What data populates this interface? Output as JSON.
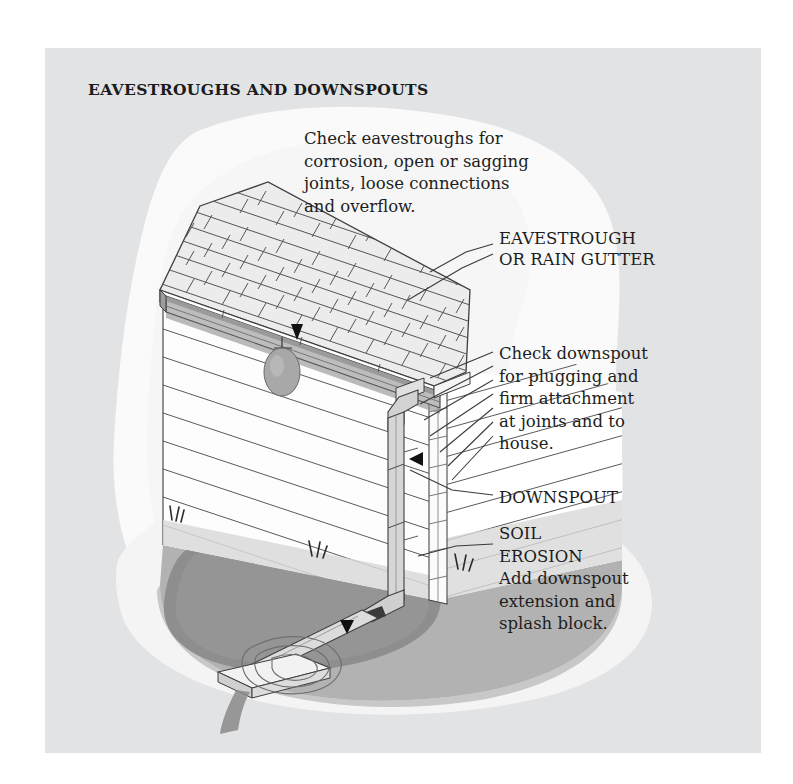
{
  "page": {
    "title": "EAVESTROUGHS AND DOWNSPOUTS",
    "panel_bg": "#e2e3e5",
    "page_bg": "#ffffff",
    "ink": "#1d1d1d"
  },
  "callouts": [
    {
      "id": "eavestrough-check",
      "text": "Check eavestroughs for\ncorrosion, open or sagging\njoints, loose connections\nand overflow."
    },
    {
      "id": "eavestrough-label",
      "text": "EAVESTROUGH\nOR RAIN GUTTER"
    },
    {
      "id": "downspout-check",
      "text": "Check downspout\nfor plugging and\nfirm attachment\nat joints and to\nhouse."
    },
    {
      "id": "downspout-label",
      "text": "DOWNSPOUT"
    },
    {
      "id": "soil-erosion",
      "text": "SOIL\nEROSION\nAdd downspout\nextension and\nsplash block."
    }
  ],
  "illustration": {
    "subject": "house-corner-with-gutter-and-downspout",
    "parts": [
      "asphalt-shingle-roof",
      "eavestrough-gutter",
      "fascia-board",
      "clapboard-siding",
      "corner-trim-board",
      "downspout-with-elbows",
      "downspout-extension",
      "splash-block",
      "soil-erosion-crater",
      "grass-tufts",
      "water-drip-leak"
    ],
    "colors": {
      "shingle_fill": "#e8e8e8",
      "shingle_line": "#4a4a4a",
      "siding_fill": "#fdfdfd",
      "siding_line": "#555555",
      "gutter_fill": "#bdbdbd",
      "downspout_fill": "#d4d4d4",
      "ground_fill": "#b0b0b0",
      "erosion_fill": "#8e8e8e",
      "blob_fill": "#fafafa",
      "pointer_fill": "#111111"
    },
    "pointers": 3
  }
}
